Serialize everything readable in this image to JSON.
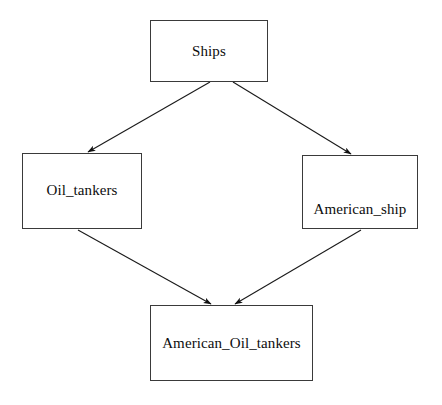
{
  "diagram": {
    "type": "inheritance-hierarchy",
    "background_color": "#ffffff",
    "node_fill": "#ffffff",
    "node_border_color": "#3a3a3a",
    "edge_color": "#1a1a1a",
    "text_color": "#0d0d0d",
    "nodes": [
      {
        "id": "ships",
        "label": "Ships"
      },
      {
        "id": "oil_tankers",
        "label": "Oil_tankers"
      },
      {
        "id": "american_ship",
        "label": "American_ship"
      },
      {
        "id": "american_oil_tankers",
        "label": "American_Oil_tankers"
      }
    ],
    "edges": [
      {
        "from": "Ships",
        "to": "Oil_tankers"
      },
      {
        "from": "Ships",
        "to": "American_ship"
      },
      {
        "from": "Oil_tankers",
        "to": "American_Oil_tankers"
      },
      {
        "from": "American_ship",
        "to": "American_Oil_tankers"
      }
    ]
  }
}
